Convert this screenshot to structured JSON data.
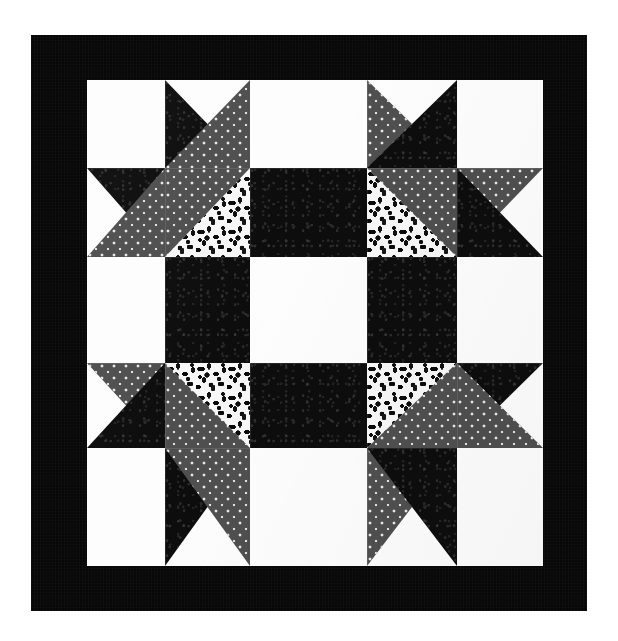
{
  "artwork": {
    "title": "Pieced Star Quilt Block",
    "kind": "quilt-block-photograph",
    "canvas": {
      "width": 618,
      "height": 641,
      "background": "#ffffff"
    },
    "border": {
      "name": "outer-black-border",
      "color": "#070707",
      "x": 31,
      "y": 35,
      "width": 556,
      "height": 576,
      "thickness_px": 46
    },
    "field": {
      "name": "pieced-field",
      "x": 87,
      "y": 80,
      "width": 456,
      "height": 486,
      "grid_rows": 5,
      "grid_cols": 5,
      "column_edges": [
        0,
        78,
        163,
        280,
        370,
        456
      ],
      "row_edges": [
        0,
        88,
        177,
        283,
        368,
        486
      ]
    },
    "fabrics": [
      {
        "id": "white",
        "label": "White solid",
        "color": "#fdfdfd"
      },
      {
        "id": "black",
        "label": "Black tonal print",
        "color": "#0d0d0d"
      },
      {
        "id": "graydot",
        "label": "Grey with white pindot",
        "color": "#585858"
      },
      {
        "id": "floral",
        "label": "Black on white floral",
        "color": "#f7f7f7"
      }
    ],
    "cells": [
      {
        "r": 0,
        "c": 0,
        "name": "corner-white-square",
        "base": "white",
        "overlays": []
      },
      {
        "r": 0,
        "c": 1,
        "name": "star-point-upper-left",
        "base": "white",
        "overlays": [
          {
            "shape": "tri-bl",
            "fabric": "black"
          },
          {
            "shape": "tri-br",
            "fabric": "graydot"
          }
        ]
      },
      {
        "r": 0,
        "c": 2,
        "name": "top-center-white",
        "base": "white",
        "overlays": []
      },
      {
        "r": 0,
        "c": 3,
        "name": "star-point-upper-right",
        "base": "white",
        "overlays": [
          {
            "shape": "tri-bl",
            "fabric": "graydot"
          },
          {
            "shape": "tri-br",
            "fabric": "black"
          }
        ]
      },
      {
        "r": 0,
        "c": 4,
        "name": "corner-white-square",
        "base": "white",
        "overlays": []
      },
      {
        "r": 1,
        "c": 0,
        "name": "left-star-point-top",
        "base": "white",
        "overlays": [
          {
            "shape": "tri-tr",
            "fabric": "black"
          },
          {
            "shape": "tri-br",
            "fabric": "graydot"
          }
        ]
      },
      {
        "r": 1,
        "c": 1,
        "name": "star-body-upper-left",
        "base": "graydot",
        "overlays": [
          {
            "shape": "tri-br",
            "fabric": "floral"
          }
        ]
      },
      {
        "r": 1,
        "c": 2,
        "name": "sash-black-top",
        "base": "black",
        "overlays": []
      },
      {
        "r": 1,
        "c": 3,
        "name": "star-body-upper-right",
        "base": "graydot",
        "overlays": [
          {
            "shape": "tri-bl",
            "fabric": "floral"
          }
        ]
      },
      {
        "r": 1,
        "c": 4,
        "name": "right-star-point-top",
        "base": "white",
        "overlays": [
          {
            "shape": "tri-tl",
            "fabric": "graydot"
          },
          {
            "shape": "tri-bl",
            "fabric": "black"
          }
        ]
      },
      {
        "r": 2,
        "c": 0,
        "name": "side-white-left",
        "base": "white",
        "overlays": []
      },
      {
        "r": 2,
        "c": 1,
        "name": "sash-black-left",
        "base": "black",
        "overlays": []
      },
      {
        "r": 2,
        "c": 2,
        "name": "center-white-square",
        "base": "white",
        "overlays": []
      },
      {
        "r": 2,
        "c": 3,
        "name": "sash-black-right",
        "base": "black",
        "overlays": []
      },
      {
        "r": 2,
        "c": 4,
        "name": "side-white-right",
        "base": "white",
        "overlays": []
      },
      {
        "r": 3,
        "c": 0,
        "name": "left-star-point-bottom",
        "base": "white",
        "overlays": [
          {
            "shape": "tri-tr",
            "fabric": "graydot"
          },
          {
            "shape": "tri-br",
            "fabric": "black"
          }
        ]
      },
      {
        "r": 3,
        "c": 1,
        "name": "star-body-lower-left",
        "base": "graydot",
        "overlays": [
          {
            "shape": "tri-tr",
            "fabric": "floral"
          }
        ]
      },
      {
        "r": 3,
        "c": 2,
        "name": "sash-black-bottom",
        "base": "black",
        "overlays": []
      },
      {
        "r": 3,
        "c": 3,
        "name": "star-body-lower-right",
        "base": "graydot",
        "overlays": [
          {
            "shape": "tri-tl",
            "fabric": "floral"
          }
        ]
      },
      {
        "r": 3,
        "c": 4,
        "name": "right-star-point-bottom",
        "base": "white",
        "overlays": [
          {
            "shape": "tri-tl",
            "fabric": "black"
          },
          {
            "shape": "tri-bl",
            "fabric": "graydot"
          }
        ]
      },
      {
        "r": 4,
        "c": 0,
        "name": "corner-white-square",
        "base": "white",
        "overlays": []
      },
      {
        "r": 4,
        "c": 1,
        "name": "star-point-lower-left",
        "base": "white",
        "overlays": [
          {
            "shape": "tri-tl",
            "fabric": "black"
          },
          {
            "shape": "tri-tr",
            "fabric": "graydot"
          }
        ]
      },
      {
        "r": 4,
        "c": 2,
        "name": "bottom-center-white",
        "base": "white",
        "overlays": []
      },
      {
        "r": 4,
        "c": 3,
        "name": "star-point-lower-right",
        "base": "white",
        "overlays": [
          {
            "shape": "tri-tl",
            "fabric": "graydot"
          },
          {
            "shape": "tri-tr",
            "fabric": "black"
          }
        ]
      },
      {
        "r": 4,
        "c": 4,
        "name": "corner-white-square",
        "base": "white",
        "overlays": []
      }
    ]
  }
}
